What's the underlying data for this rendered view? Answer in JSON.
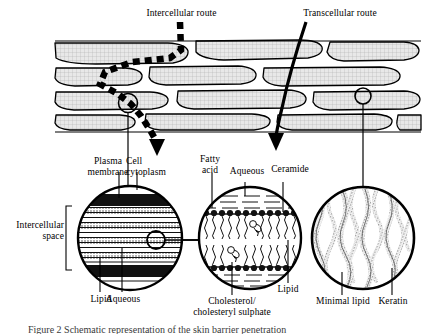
{
  "figure": {
    "title_top_left": "Intercellular route",
    "title_top_right": "Transcellular route",
    "caption_partial": "Figure 2  Schematic representation of the skin barrier penetration"
  },
  "routes": [
    {
      "name": "intercellular-route",
      "label": "Intercellular route",
      "style": "dashed"
    },
    {
      "name": "transcellular-route",
      "label": "Transcellular route",
      "style": "solid"
    }
  ],
  "labels": {
    "plasma_membrane": "Plasma\nmembrane",
    "cell_cytoplasm": "Cell\ncytoplasm",
    "fatty_acid": "Fatty\nacid",
    "aqueous_top": "Aqueous",
    "ceramide": "Ceramide",
    "intercellular_space": "Intercellular\nspace",
    "lipid_bottom_left": "Lipid",
    "aqueous_bottom_left": "Aqueous",
    "cholesterol": "Cholesterol/\ncholesteryl sulphate",
    "lipid_mid_right": "Lipid",
    "minimal_lipid": "Minimal lipid",
    "keratin": "Keratin"
  },
  "insets": [
    {
      "id": "inset-lamellae",
      "name": "intercellular-lipid-lamellae-inset",
      "description": "Stacked alternating lipid and aqueous lamellae between two plasma membranes",
      "layers": [
        "Plasma membrane",
        "Lipid",
        "Aqueous",
        "Lipid",
        "Aqueous",
        "Lipid",
        "Plasma membrane"
      ],
      "callout_labels": [
        "Plasma membrane",
        "Cell cytoplasm",
        "Intercellular space",
        "Lipid",
        "Aqueous"
      ]
    },
    {
      "id": "inset-bilayer",
      "name": "lipid-bilayer-inset",
      "description": "Lipid bilayer with polar head groups facing aqueous regions and wavy hydrocarbon tails",
      "callout_labels": [
        "Fatty acid",
        "Aqueous",
        "Ceramide",
        "Cholesterol/cholesteryl sulphate",
        "Lipid"
      ]
    },
    {
      "id": "inset-keratin",
      "name": "corneocyte-keratin-inset",
      "description": "Corneocyte interior packed with vertical wavy keratin filaments and minimal lipid",
      "callout_labels": [
        "Minimal lipid",
        "Keratin"
      ]
    }
  ],
  "colors": {
    "ink": "#000000",
    "tissue_fill": "#e2e2e2",
    "hatch": "#9a9a9a",
    "paper": "#ffffff",
    "caption": "#3a3a3a"
  }
}
